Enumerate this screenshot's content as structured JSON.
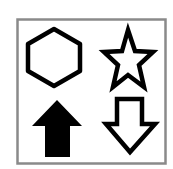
{
  "panel": {
    "border_color": "#8a8a8a",
    "background": "#ffffff"
  },
  "icons": [
    {
      "name": "hexagon-outline",
      "style": "outline",
      "color": "#000000"
    },
    {
      "name": "star-outline",
      "style": "outline",
      "color": "#000000"
    },
    {
      "name": "arrow-up-filled",
      "style": "filled",
      "color": "#000000"
    },
    {
      "name": "arrow-down-outline",
      "style": "outline",
      "color": "#000000"
    }
  ]
}
